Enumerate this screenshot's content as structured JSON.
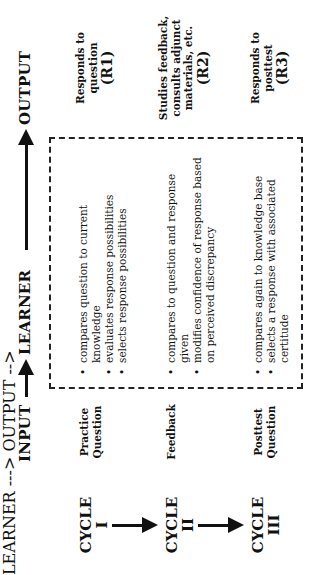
{
  "header": {
    "input": "INPUT",
    "learner": "LEARNER",
    "output": "OUTPUT"
  },
  "cycles": [
    {
      "label": "CYCLE",
      "numeral": "I",
      "input": [
        "Practice",
        "Question"
      ],
      "learner": [
        "compares question to current knowledge",
        "evaluates response possibilities",
        "selects response possibilities"
      ],
      "output": [
        "Responds to",
        "question"
      ],
      "output_code": "(R1)"
    },
    {
      "label": "CYCLE",
      "numeral": "II",
      "input": [
        "Feedback"
      ],
      "learner": [
        "compares to question and response given",
        "modifies confidence of response based on perceived discrepancy"
      ],
      "output": [
        "Studies feedback,",
        "consults adjunct",
        "materials, etc."
      ],
      "output_code": "(R2)"
    },
    {
      "label": "CYCLE",
      "numeral": "III",
      "input": [
        "Posttest",
        "Question"
      ],
      "learner": [
        "compares again to knowledge base",
        "selects a response with associated certitude"
      ],
      "output": [
        "Responds to",
        "posttest"
      ],
      "output_code": "(R3)"
    }
  ]
}
